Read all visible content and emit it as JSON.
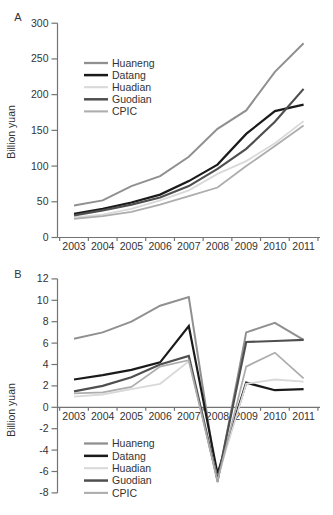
{
  "figure": {
    "background": "#ffffff",
    "axis_color": "#737373",
    "text_color": "#333333"
  },
  "chart_data": [
    {
      "panel_label": "A",
      "type": "line",
      "title": "",
      "xlabel": "",
      "ylabel": "Billion yuan",
      "categories": [
        "2003",
        "2004",
        "2005",
        "2006",
        "2007",
        "2008",
        "2009",
        "2010",
        "2011"
      ],
      "ylim": [
        0,
        300
      ],
      "ytick_step": 50,
      "grid": false,
      "legend_position": "upper-left-inside",
      "series": [
        {
          "name": "Huaneng",
          "color": "#909090",
          "width": 2,
          "values": [
            45,
            52,
            72,
            86,
            113,
            152,
            178,
            232,
            272
          ]
        },
        {
          "name": "Datang",
          "color": "#1a1a1a",
          "width": 2.2,
          "values": [
            33,
            40,
            49,
            60,
            79,
            102,
            145,
            177,
            186
          ]
        },
        {
          "name": "Huadian",
          "color": "#d9d9d9",
          "width": 1.8,
          "values": [
            28,
            32,
            40,
            52,
            66,
            89,
            107,
            132,
            163
          ]
        },
        {
          "name": "Guodian",
          "color": "#4f4f4f",
          "width": 2.2,
          "values": [
            31,
            38,
            46,
            56,
            72,
            96,
            124,
            162,
            208
          ]
        },
        {
          "name": "CPIC",
          "color": "#adadad",
          "width": 1.8,
          "values": [
            26,
            30,
            36,
            46,
            58,
            70,
            100,
            128,
            157
          ]
        }
      ]
    },
    {
      "panel_label": "B",
      "type": "line",
      "title": "",
      "xlabel": "",
      "ylabel": "Billion yuan",
      "categories": [
        "2003",
        "2004",
        "2005",
        "2006",
        "2007",
        "2008",
        "2009",
        "2010",
        "2011"
      ],
      "ylim": [
        -8,
        12
      ],
      "ytick_step": 2,
      "grid": false,
      "legend_position": "lower-left-inside",
      "series": [
        {
          "name": "Huaneng",
          "color": "#909090",
          "width": 2,
          "values": [
            6.4,
            7.0,
            8.0,
            9.5,
            10.3,
            -7.0,
            7.0,
            7.9,
            6.3
          ]
        },
        {
          "name": "Datang",
          "color": "#1a1a1a",
          "width": 2.2,
          "values": [
            2.6,
            3.0,
            3.5,
            4.2,
            7.6,
            -6.2,
            2.3,
            1.6,
            1.7
          ]
        },
        {
          "name": "Huadian",
          "color": "#d9d9d9",
          "width": 1.8,
          "values": [
            1.0,
            1.2,
            1.7,
            2.2,
            4.3,
            -6.6,
            2.2,
            2.6,
            2.4
          ]
        },
        {
          "name": "Guodian",
          "color": "#4f4f4f",
          "width": 2.2,
          "values": [
            1.5,
            2.0,
            2.8,
            4.0,
            4.8,
            -6.8,
            6.1,
            6.2,
            6.3
          ]
        },
        {
          "name": "CPIC",
          "color": "#adadad",
          "width": 1.8,
          "values": [
            1.3,
            1.4,
            1.9,
            3.8,
            4.4,
            -6.9,
            3.8,
            5.1,
            2.7
          ]
        }
      ]
    }
  ]
}
